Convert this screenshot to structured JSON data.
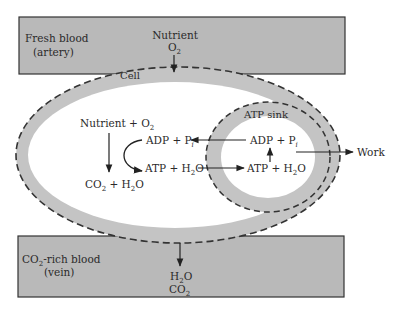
{
  "colors": {
    "blood_box_fill": "#b9b9b9",
    "blood_box_stroke": "#333333",
    "membrane_band": "#c4c4c4",
    "interior": "#ffffff",
    "line": "#222222"
  },
  "artery_box": {
    "title": "Fresh blood",
    "subtitle": "(artery)",
    "input_label_1": "Nutrient",
    "input_label_2_main": "O",
    "input_label_2_sub": "2"
  },
  "vein_box": {
    "title_main": "CO",
    "title_sub": "2",
    "title_rest": "-rich blood",
    "subtitle": "(vein)",
    "output_label_1_main": "H",
    "output_label_1_sub": "2",
    "output_label_1_rest": "O",
    "output_label_2_main": "CO",
    "output_label_2_sub": "2"
  },
  "cell": {
    "label": "Cell",
    "reaction_input": "Nutrient + O",
    "reaction_input_sub": "2",
    "reaction_output_a": "CO",
    "reaction_output_a_sub": "2",
    "reaction_output_b": " + H",
    "reaction_output_b_sub": "2",
    "reaction_output_c": "O",
    "adp_label": "ADP + P",
    "adp_sub": "i",
    "atp_label": "ATP + H",
    "atp_sub": "2",
    "atp_rest": "O"
  },
  "atp_sink": {
    "label": "ATP sink",
    "adp_label": "ADP + P",
    "adp_sub": "i",
    "atp_label": "ATP + H",
    "atp_sub": "2",
    "atp_rest": "O"
  },
  "work_label": "Work"
}
